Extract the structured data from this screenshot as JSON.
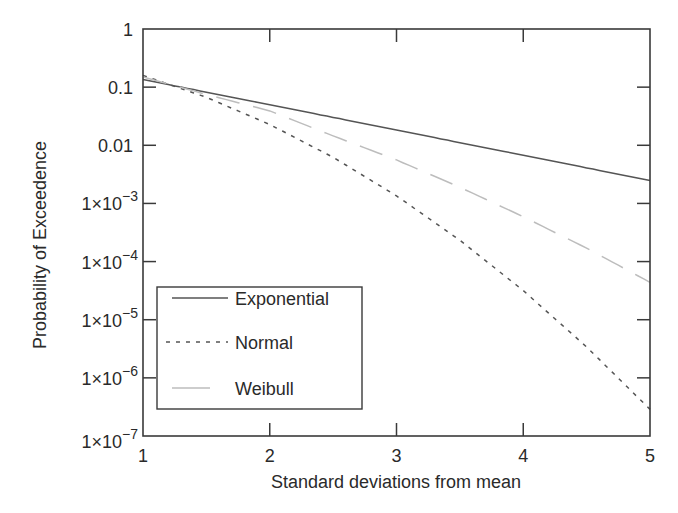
{
  "chart_data": {
    "type": "line",
    "title": "",
    "xlabel": "Standard deviations from mean",
    "ylabel": "Probability of Exceedence",
    "xlim": [
      1,
      5
    ],
    "ylim": [
      1e-07,
      1
    ],
    "yscale": "log",
    "grid": false,
    "legend_position": "lower left",
    "x_ticks": [
      "1",
      "2",
      "3",
      "4",
      "5"
    ],
    "y_ticks": [
      {
        "value": 1,
        "label": "1"
      },
      {
        "value": 0.1,
        "label": "0.1"
      },
      {
        "value": 0.01,
        "label": "0.01"
      },
      {
        "value": 0.001,
        "label": "1×10",
        "exp": "−3"
      },
      {
        "value": 0.0001,
        "label": "1×10",
        "exp": "−4"
      },
      {
        "value": 1e-05,
        "label": "1×10",
        "exp": "−5"
      },
      {
        "value": 1e-06,
        "label": "1×10",
        "exp": "−6"
      },
      {
        "value": 1e-07,
        "label": "1×10",
        "exp": "−7"
      }
    ],
    "x": [
      1,
      1.5,
      2,
      2.5,
      3,
      3.5,
      4,
      4.5,
      5
    ],
    "series": [
      {
        "name": "Exponential",
        "style": "solid",
        "color": "#555555",
        "values": [
          0.135,
          0.082,
          0.0498,
          0.0302,
          0.0183,
          0.0111,
          0.00674,
          0.00409,
          0.00248
        ]
      },
      {
        "name": "Normal",
        "style": "dashed",
        "color": "#555555",
        "values": [
          0.159,
          0.0668,
          0.0228,
          0.00621,
          0.00135,
          0.000233,
          3.17e-05,
          3.4e-06,
          2.87e-07
        ]
      },
      {
        "name": "Weibull",
        "style": "long-dash",
        "color": "#bdbdbd",
        "values": [
          0.15,
          0.075,
          0.039,
          0.0145,
          0.0056,
          0.0019,
          0.00059,
          0.00017,
          4.4e-05
        ]
      }
    ]
  }
}
